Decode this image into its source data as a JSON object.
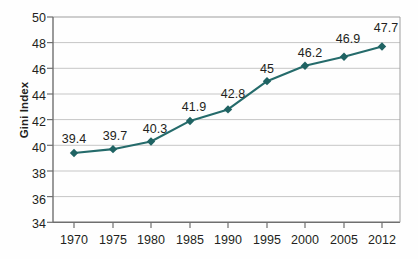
{
  "chart_data": {
    "type": "line",
    "title": "",
    "subtitle": "",
    "xlabel": "",
    "ylabel": "Gini Index",
    "categories": [
      "1970",
      "1975",
      "1980",
      "1985",
      "1990",
      "1995",
      "2000",
      "2005",
      "2012"
    ],
    "x": [
      1970,
      1975,
      1980,
      1985,
      1990,
      1995,
      2000,
      2005,
      2012
    ],
    "values": [
      39.4,
      39.7,
      40.3,
      41.9,
      42.8,
      45,
      46.2,
      46.9,
      47.7
    ],
    "point_labels": [
      "39.4",
      "39.7",
      "40.3",
      "41.9",
      "42.8",
      "45",
      "46.2",
      "46.9",
      "47.7"
    ],
    "ylim": [
      34,
      50
    ],
    "yticks": [
      34,
      36,
      38,
      40,
      42,
      44,
      46,
      48,
      50
    ],
    "ytick_labels": [
      "34",
      "36",
      "38",
      "40",
      "42",
      "44",
      "46",
      "48",
      "50"
    ],
    "grid": true,
    "grid_axis": "y",
    "legend": false,
    "legend_position": "none",
    "series": [
      {
        "name": "Gini Index",
        "values": [
          39.4,
          39.7,
          40.3,
          41.9,
          42.8,
          45,
          46.2,
          46.9,
          47.7
        ]
      }
    ],
    "colors": {
      "line": "#256b6b",
      "marker": "#1f6363",
      "grid": "#bdbdbd",
      "axis": "#808080",
      "text": "#231f20",
      "background": "#fefefe"
    },
    "marker_style": "diamond"
  }
}
